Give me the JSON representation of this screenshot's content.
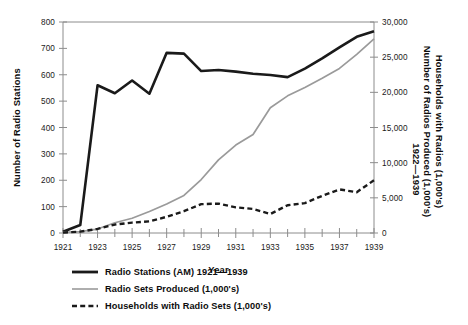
{
  "chart_data": {
    "type": "line",
    "title": "",
    "xlabel": "Year",
    "ylabel_left": "Number of Radio Stations",
    "ylabel_right_line1": "Number of Radios Produced (1,000's)",
    "ylabel_right_line2": "Households with Radios (1,000's)",
    "ylabel_right_line3": "1922—1939",
    "x": [
      1921,
      1922,
      1923,
      1924,
      1925,
      1926,
      1927,
      1928,
      1929,
      1930,
      1931,
      1932,
      1933,
      1934,
      1935,
      1936,
      1937,
      1938,
      1939
    ],
    "xlim": [
      1921,
      1939
    ],
    "xticks_major": [
      1921,
      1923,
      1925,
      1927,
      1929,
      1931,
      1933,
      1935,
      1937,
      1939
    ],
    "xtick_labels": [
      "1921",
      "1923",
      "1925",
      "1927",
      "1929",
      "1931",
      "1933",
      "1935",
      "1937",
      "1939"
    ],
    "xticks_minor": [
      1922,
      1924,
      1926,
      1928,
      1930,
      1932,
      1934,
      1936,
      1938
    ],
    "ylim_left": [
      0,
      800
    ],
    "yticks_left": [
      0,
      100,
      200,
      300,
      400,
      500,
      600,
      700,
      800
    ],
    "ytick_labels_left": [
      "0",
      "100",
      "200",
      "300",
      "400",
      "500",
      "600",
      "700",
      "800"
    ],
    "ylim_right": [
      0,
      30000
    ],
    "yticks_right": [
      0,
      5000,
      10000,
      15000,
      20000,
      25000,
      30000
    ],
    "ytick_labels_right": [
      "0",
      "5,000",
      "10,000",
      "15,000",
      "20,000",
      "25,000",
      "30,000"
    ],
    "grid": false,
    "legend_position": "below",
    "series": [
      {
        "name": "Radio Stations (AM) 1921—1939",
        "axis": "left",
        "style": "solid",
        "color": "#1a1a1a",
        "width": 2.6,
        "values": [
          5,
          30,
          560,
          530,
          578,
          528,
          683,
          680,
          614,
          618,
          612,
          604,
          599,
          591,
          623,
          662,
          704,
          744,
          765
        ]
      },
      {
        "name": "Radio Sets Produced (1,000's)",
        "axis": "right",
        "style": "solid",
        "color": "#9a9a9a",
        "width": 1.7,
        "values": [
          100,
          190,
          560,
          1460,
          2100,
          3050,
          4120,
          5340,
          7600,
          10400,
          12500,
          14000,
          17800,
          19500,
          20700,
          22000,
          23400,
          25400,
          27600
        ]
      },
      {
        "name": "Households with Radio Sets (1,000's)",
        "axis": "right",
        "style": "dashed",
        "color": "#1a1a1a",
        "width": 2.4,
        "values": [
          60,
          190,
          580,
          1200,
          1480,
          1650,
          2300,
          3100,
          4100,
          4180,
          3650,
          3420,
          2700,
          3950,
          4250,
          5280,
          6200,
          5800,
          7500
        ]
      }
    ],
    "series_right_override": {
      "note": "households dashed sampled values",
      "households": [
        60,
        190,
        580,
        1200,
        1480,
        1650,
        2300,
        3100,
        4100,
        4180,
        3650,
        3420,
        2700,
        3950,
        4250,
        5280,
        6200,
        5800,
        7500
      ]
    }
  },
  "legend": {
    "items": [
      {
        "label": "Radio Stations (AM) 1921—1939",
        "style": "solid",
        "color": "#1a1a1a",
        "width": 2.8
      },
      {
        "label": "Radio Sets Produced (1,000's)",
        "style": "solid",
        "color": "#9a9a9a",
        "width": 1.6
      },
      {
        "label": "Households with Radio Sets (1,000's)",
        "style": "dashed",
        "color": "#1a1a1a",
        "width": 2.4
      }
    ]
  }
}
